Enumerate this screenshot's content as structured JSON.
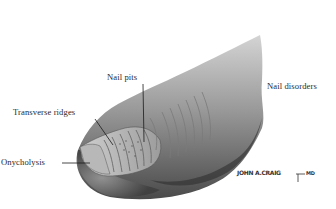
{
  "figure": {
    "title": "Nail disorders",
    "labels": [
      {
        "id": "nail-pits",
        "text": "Nail pits"
      },
      {
        "id": "transverse-ridges",
        "text": "Transverse ridges"
      },
      {
        "id": "onycholysis",
        "text": "Onycholysis"
      }
    ],
    "signature": "JOHN A.CRAIG",
    "signature_suffix": "MD"
  },
  "colors": {
    "background": "#ffffff",
    "skin_dark": "#3a3a3a",
    "skin_mid": "#8a8a8a",
    "skin_light": "#c8c8c8",
    "label_text": "#2a2a2a"
  }
}
